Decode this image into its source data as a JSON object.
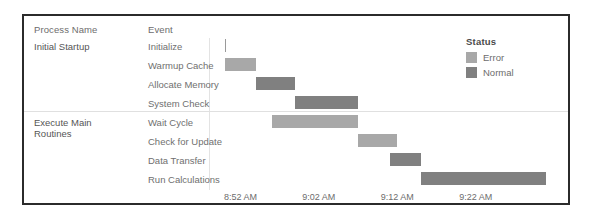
{
  "columns": {
    "process_header": "Process Name",
    "event_header": "Event"
  },
  "legend": {
    "title": "Status",
    "items": [
      {
        "label": "Error",
        "color": "#a8a8a8"
      },
      {
        "label": "Normal",
        "color": "#808080"
      }
    ]
  },
  "groups": [
    {
      "name": "Initial Startup",
      "rows": 4
    },
    {
      "name": "Execute Main\nRoutines",
      "rows": 4
    }
  ],
  "chart_data": {
    "type": "bar",
    "title": "",
    "xlabel": "",
    "ylabel": "",
    "orientation": "horizontal",
    "subtype": "gantt",
    "grid": false,
    "legend_position": "top-right",
    "axis_ticks": [
      "8:52 AM",
      "9:02 AM",
      "9:12 AM",
      "9:22 AM"
    ],
    "axis_tick_minutes": [
      532,
      542,
      552,
      562
    ],
    "xlim_minutes": [
      528,
      574
    ],
    "categories": [
      "Initialize",
      "Warmup Cache",
      "Allocate Memory",
      "System Check",
      "Wait Cycle",
      "Check for Update",
      "Data Transfer",
      "Run Calculations"
    ],
    "series": [
      {
        "name": "Initialize",
        "process": "Initial Startup",
        "status": "Error",
        "start": "8:50 AM",
        "end": "8:50 AM",
        "start_min": 530,
        "end_min": 530,
        "duration_min": 0
      },
      {
        "name": "Warmup Cache",
        "process": "Initial Startup",
        "status": "Error",
        "start": "8:50 AM",
        "end": "8:54 AM",
        "start_min": 530,
        "end_min": 534,
        "duration_min": 4
      },
      {
        "name": "Allocate Memory",
        "process": "Initial Startup",
        "status": "Normal",
        "start": "8:54 AM",
        "end": "8:59 AM",
        "start_min": 534,
        "end_min": 539,
        "duration_min": 5
      },
      {
        "name": "System Check",
        "process": "Initial Startup",
        "status": "Normal",
        "start": "8:59 AM",
        "end": "9:07 AM",
        "start_min": 539,
        "end_min": 547,
        "duration_min": 8
      },
      {
        "name": "Wait Cycle",
        "process": "Execute Main Routines",
        "status": "Error",
        "start": "8:56 AM",
        "end": "9:07 AM",
        "start_min": 536,
        "end_min": 547,
        "duration_min": 11
      },
      {
        "name": "Check for Update",
        "process": "Execute Main Routines",
        "status": "Error",
        "start": "9:07 AM",
        "end": "9:12 AM",
        "start_min": 547,
        "end_min": 552,
        "duration_min": 5
      },
      {
        "name": "Data Transfer",
        "process": "Execute Main Routines",
        "status": "Normal",
        "start": "9:11 AM",
        "end": "9:15 AM",
        "start_min": 551,
        "end_min": 555,
        "duration_min": 4
      },
      {
        "name": "Run Calculations",
        "process": "Execute Main Routines",
        "status": "Normal",
        "start": "9:15 AM",
        "end": "9:31 AM",
        "start_min": 555,
        "end_min": 571,
        "duration_min": 16
      }
    ]
  }
}
